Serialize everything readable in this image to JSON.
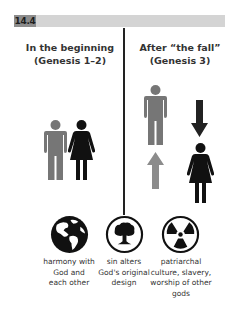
{
  "figure": {
    "label": "14.4",
    "colors": {
      "header_bar": "#d4d4d4",
      "label_box": "#8c8c8c",
      "man": "#767676",
      "woman": "#111111",
      "up_arrow": "#8c8c8c",
      "down_arrow": "#222222",
      "divider": "#222222"
    }
  },
  "columns": {
    "left": {
      "title": "In the beginning",
      "subtitle": "(Genesis 1–2)",
      "figures": [
        "man",
        "woman"
      ]
    },
    "right": {
      "title": "After “the fall”",
      "subtitle": "(Genesis 3)",
      "figures": [
        "man",
        "up-arrow",
        "down-arrow",
        "woman"
      ]
    }
  },
  "icons": [
    {
      "name": "globe-icon",
      "caption_lines": [
        "harmony with",
        "God and",
        "each other"
      ]
    },
    {
      "name": "mushroom-cloud-icon",
      "caption_lines": [
        "sin alters",
        "God's original",
        "design"
      ]
    },
    {
      "name": "radiation-icon",
      "caption_lines": [
        "patriarchal",
        "culture, slavery,",
        "worship of other",
        "gods"
      ]
    }
  ]
}
